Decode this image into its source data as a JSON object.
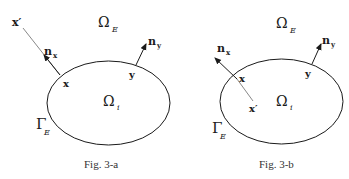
{
  "figures": [
    {
      "id": "fig-3a",
      "caption": "Fig. 3-a",
      "labels": {
        "x_prime": "x′",
        "omega_e": "Ω",
        "omega_e_sub": "E",
        "n_x": "n",
        "n_x_sub": "x",
        "n_y": "n",
        "n_y_sub": "y",
        "x": "x",
        "y": "y",
        "omega_i": "Ω",
        "omega_i_sub": "i",
        "gamma_e": "Γ",
        "gamma_e_sub": "E"
      }
    },
    {
      "id": "fig-3b",
      "caption": "Fig. 3-b",
      "labels": {
        "x_prime": "x′",
        "omega_e": "Ω",
        "omega_e_sub": "E",
        "n_x": "n",
        "n_x_sub": "x",
        "n_y": "n",
        "n_y_sub": "y",
        "x": "x",
        "y": "y",
        "omega_i": "Ω",
        "omega_i_sub": "i",
        "gamma_e": "Γ",
        "gamma_e_sub": "E"
      }
    }
  ],
  "colors": {
    "stroke": "#1a1a1a",
    "background": "#ffffff"
  }
}
